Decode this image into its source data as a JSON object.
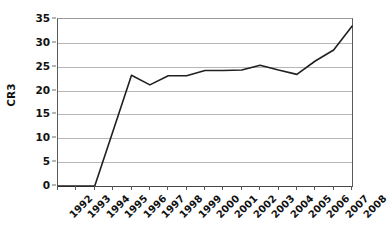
{
  "chart_data": {
    "type": "line",
    "title": "",
    "xlabel": "",
    "ylabel": "CR3",
    "categories": [
      "1992",
      "1993",
      "1994",
      "1995",
      "1996",
      "1997",
      "1998",
      "1999",
      "2000",
      "2001",
      "2002",
      "2003",
      "2004",
      "2005",
      "2006",
      "2007",
      "2008"
    ],
    "values": [
      0,
      0,
      0,
      11.6,
      23.2,
      21.2,
      23.1,
      23.1,
      24.2,
      24.2,
      24.3,
      25.3,
      24.3,
      23.4,
      26.2,
      28.5,
      33.5
    ],
    "series": [
      {
        "name": "CR3",
        "values": [
          0,
          0,
          0,
          11.6,
          23.2,
          21.2,
          23.1,
          23.1,
          24.2,
          24.2,
          24.3,
          25.3,
          24.3,
          23.4,
          26.2,
          28.5,
          33.5
        ]
      }
    ],
    "ylim": [
      0,
      35
    ],
    "y_ticks": [
      0,
      5,
      10,
      15,
      20,
      25,
      30,
      35
    ],
    "y_tick_labels": [
      "0",
      "5",
      "10",
      "15",
      "20",
      "25",
      "30",
      "35"
    ],
    "x_tick_labels": [
      "1992",
      "1993",
      "1994",
      "1995",
      "1996",
      "1997",
      "1998",
      "1999",
      "2000",
      "2001",
      "2002",
      "2003",
      "2004",
      "2005",
      "2006",
      "2007",
      "2008"
    ],
    "grid": true,
    "grid_axis": "y",
    "legend": false,
    "legend_position": "none",
    "line_color": "#231f20",
    "line_width": 1.6,
    "markers": false,
    "plot_background": "#ffffff",
    "gridline_color": "#b6b6b6",
    "axis_color": "#4a4a4a",
    "x_label_rotation": -45
  }
}
